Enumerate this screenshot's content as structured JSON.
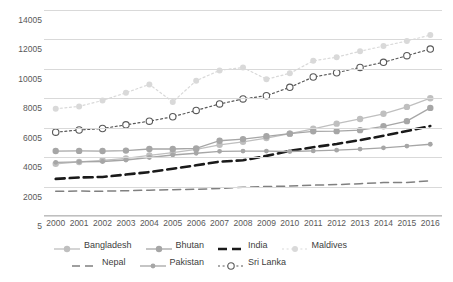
{
  "chart_data": {
    "type": "line",
    "title": "",
    "xlabel": "",
    "ylabel": "",
    "ylim": [
      5,
      14005
    ],
    "yticks": [
      5,
      2005,
      4005,
      6005,
      8005,
      10005,
      12005,
      14005
    ],
    "ytick_labels": [
      "5",
      "2005",
      "4005",
      "6005",
      "8005",
      "10005",
      "12005",
      "14005"
    ],
    "grid": true,
    "legend_position": "bottom",
    "x": [
      2000,
      2001,
      2002,
      2003,
      2004,
      2005,
      2006,
      2007,
      2008,
      2009,
      2010,
      2011,
      2012,
      2013,
      2014,
      2015,
      2016
    ],
    "xtick_labels": [
      "2000",
      "2001",
      "2002",
      "2003",
      "2004",
      "2005",
      "2006",
      "2007",
      "2008",
      "2009",
      "2010",
      "2011",
      "2012",
      "2013",
      "2014",
      "2015",
      "2016"
    ],
    "series": [
      {
        "name": "Bangladesh",
        "color": "#bfbfbf",
        "style": "solid-marker",
        "values": [
          3550,
          3680,
          3790,
          3920,
          4120,
          4310,
          4540,
          4840,
          5050,
          5300,
          5600,
          5930,
          6280,
          6600,
          6950,
          7420,
          8010
        ]
      },
      {
        "name": "Bhutan",
        "color": "#a6a6a6",
        "style": "solid-marker",
        "values": [
          4420,
          4430,
          4420,
          4450,
          4560,
          4560,
          4600,
          5120,
          5230,
          5420,
          5600,
          5760,
          5770,
          5840,
          6100,
          6450,
          7350
        ]
      },
      {
        "name": "India",
        "color": "#1a1a1a",
        "style": "dashed",
        "values": [
          2530,
          2620,
          2660,
          2820,
          2990,
          3220,
          3450,
          3700,
          3790,
          4090,
          4430,
          4680,
          4900,
          5160,
          5460,
          5780,
          6120
        ]
      },
      {
        "name": "Maldives",
        "color": "#d9d9d9",
        "style": "dotted-marker",
        "values": [
          7300,
          7450,
          7860,
          8380,
          8950,
          7760,
          9200,
          9900,
          10100,
          9300,
          9700,
          10550,
          10800,
          11200,
          11550,
          11900,
          12300
        ]
      },
      {
        "name": "Nepal",
        "color": "#808080",
        "style": "dashed-long",
        "values": [
          1680,
          1700,
          1690,
          1720,
          1760,
          1790,
          1820,
          1870,
          1960,
          2010,
          2040,
          2100,
          2140,
          2200,
          2280,
          2280,
          2400
        ]
      },
      {
        "name": "Pakistan",
        "color": "#a6a6a6",
        "style": "solid-marker-sm",
        "values": [
          3650,
          3690,
          3710,
          3810,
          3980,
          4150,
          4270,
          4400,
          4420,
          4420,
          4390,
          4430,
          4480,
          4550,
          4640,
          4760,
          4880
        ]
      },
      {
        "name": "Sri Lanka",
        "color": "#595959",
        "style": "dotted-circle",
        "values": [
          5700,
          5850,
          5950,
          6200,
          6450,
          6750,
          7180,
          7620,
          7960,
          8180,
          8750,
          9450,
          9740,
          10100,
          10450,
          10900,
          11350
        ]
      }
    ]
  },
  "legend": {
    "items": [
      {
        "label": "Bangladesh"
      },
      {
        "label": "Bhutan"
      },
      {
        "label": "India"
      },
      {
        "label": "Maldives"
      },
      {
        "label": "Nepal"
      },
      {
        "label": "Pakistan"
      },
      {
        "label": "Sri Lanka"
      }
    ]
  }
}
